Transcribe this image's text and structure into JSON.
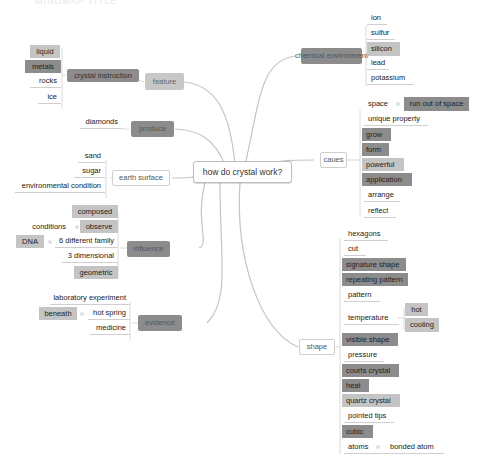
{
  "title_faint": "MINDMAP TITLE",
  "root": {
    "label": "how do crystal work?"
  },
  "branches": {
    "feature": {
      "label": "feature",
      "child": {
        "label": "crystal instruction"
      },
      "leaves": [
        "liquid",
        "metals",
        "rocks",
        "ice"
      ]
    },
    "produce": {
      "label": "produce",
      "leaves": [
        "diamonds"
      ]
    },
    "earth_surface": {
      "label": "earth surface",
      "leaves": [
        "sand",
        "sugar",
        "environmental condition"
      ]
    },
    "influence": {
      "label": "influence",
      "leaves": [
        "composed",
        "observe",
        "6 different family",
        "3 dimensional",
        "geometric"
      ],
      "sub": {
        "observe": "conditions",
        "six_family": "DNA"
      }
    },
    "evidence": {
      "label": "evidence",
      "leaves": [
        "laboratory experiment",
        "hot spring",
        "medicine"
      ],
      "sub": {
        "hot_spring": "beneath"
      }
    },
    "chemical_environment": {
      "label": "chemical environment",
      "leaves": [
        "ion",
        "sulfur",
        "silicon",
        "lead",
        "potassium"
      ]
    },
    "caues": {
      "label": "caues",
      "leaves": [
        "space",
        "unique property",
        "grow",
        "form",
        "powerful",
        "application",
        "arrange",
        "reflect"
      ],
      "sub": {
        "space": "run out of space"
      }
    },
    "shape": {
      "label": "shape",
      "leaves": [
        "hexagons",
        "cut",
        "signature shape",
        "repeating pattern",
        "pattern",
        "temperature",
        "visible shape",
        "pressure",
        "courts crystal",
        "heat",
        "quartz crystal",
        "pointed tips",
        "cubic",
        "atoms"
      ],
      "sub": {
        "temperature": [
          "hot",
          "cooling"
        ],
        "atoms": "bonded atom"
      }
    }
  },
  "colors": {
    "dark": "#8c8c8c",
    "mid": "#a8a8a8",
    "light": "#c4c4c4",
    "line": "#bdbdbd"
  }
}
